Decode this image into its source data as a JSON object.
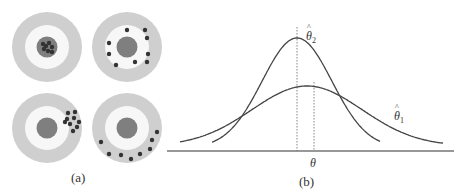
{
  "panel_a": {
    "caption": "(a)",
    "colors": {
      "outer_ring": "#cfcfcf",
      "inner_ring": "#f7f7f7",
      "bullseye": "#7f7f7f",
      "dot": "#333333"
    },
    "targets": [
      {
        "name": "low-bias-low-variance",
        "cx": 47,
        "cy": 47,
        "dots": [
          [
            43,
            44
          ],
          [
            49,
            43
          ],
          [
            52,
            47
          ],
          [
            44,
            49
          ],
          [
            48,
            51
          ],
          [
            52,
            52
          ],
          [
            46,
            46
          ]
        ]
      },
      {
        "name": "low-bias-high-variance",
        "cx": 127,
        "cy": 47,
        "dots": [
          [
            127,
            30
          ],
          [
            145,
            30
          ],
          [
            147,
            38
          ],
          [
            109,
            43
          ],
          [
            109,
            54
          ],
          [
            148,
            54
          ],
          [
            116,
            65
          ],
          [
            135,
            62
          ],
          [
            147,
            62
          ]
        ]
      },
      {
        "name": "high-bias-low-variance",
        "cx": 47,
        "cy": 128,
        "dots": [
          [
            68,
            113
          ],
          [
            75,
            112
          ],
          [
            67,
            119
          ],
          [
            74,
            118
          ],
          [
            79,
            122
          ],
          [
            70,
            124
          ],
          [
            77,
            127
          ],
          [
            73,
            131
          ],
          [
            65,
            122
          ]
        ]
      },
      {
        "name": "high-bias-high-variance",
        "cx": 127,
        "cy": 128,
        "dots": [
          [
            101,
            142
          ],
          [
            109,
            154
          ],
          [
            121,
            155
          ],
          [
            131,
            159
          ],
          [
            140,
            154
          ],
          [
            150,
            149
          ],
          [
            152,
            140
          ],
          [
            157,
            132
          ]
        ]
      }
    ]
  },
  "panel_b": {
    "caption": "(b)",
    "axis_label": "θ",
    "curve_labels": {
      "estimator_1": "θ̂1",
      "estimator_2": "θ̂2"
    },
    "colors": {
      "curve": "#444444",
      "axis": "#333333",
      "guide": "#666666"
    }
  },
  "chart_data": {
    "type": "line",
    "title": "",
    "xlabel": "θ",
    "ylabel": "",
    "grid": false,
    "legend": "inline labels",
    "series": [
      {
        "name": "θ̂2",
        "description": "narrow, tall sampling distribution centered slightly left of θ (biased, low variance)",
        "peak_x": 297,
        "peak_y_px": 38,
        "x_range_px": [
          212,
          380
        ]
      },
      {
        "name": "θ̂1",
        "description": "wide, flat sampling distribution centered on θ (unbiased, high variance)",
        "peak_x": 307,
        "peak_y_px": 86,
        "x_range_px": [
          180,
          443
        ]
      }
    ],
    "annotations": [
      {
        "type": "vline",
        "x_px": 297,
        "style": "dotted",
        "meaning": "mean of θ̂2"
      },
      {
        "type": "vline",
        "x_px": 314,
        "style": "dotted",
        "meaning": "true θ"
      }
    ]
  }
}
